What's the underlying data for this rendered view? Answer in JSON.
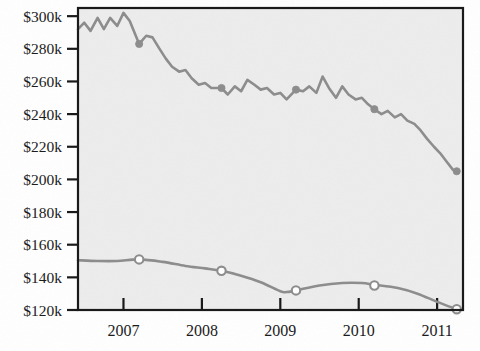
{
  "chart_data": {
    "type": "line",
    "title": "",
    "subtitle": "",
    "xlabel": "",
    "ylabel": "",
    "xlim": [
      2006.42,
      2011.33
    ],
    "ylim": [
      120000,
      305000
    ],
    "grid": false,
    "legend_position": "none",
    "background_color": "#ededed",
    "border_color": "#1a1a1a",
    "y_ticks": [
      120000,
      140000,
      160000,
      180000,
      200000,
      220000,
      240000,
      260000,
      280000,
      300000
    ],
    "y_tick_labels": [
      "$120k",
      "$140k",
      "$160k",
      "$180k",
      "$200k",
      "$220k",
      "$240k",
      "$260k",
      "$280k",
      "$300k"
    ],
    "x_ticks": [
      2007,
      2008,
      2009,
      2010,
      2011
    ],
    "x_tick_labels": [
      "2007",
      "2008",
      "2009",
      "2010",
      "2011"
    ],
    "series": [
      {
        "name": "upper-series",
        "style": "jagged",
        "color": "#8d8d8d",
        "line_width": 2.6,
        "marker": "filled-circle",
        "marker_color": "#8d8d8d",
        "marker_radius": 3.6,
        "marker_x": [
          2007.2,
          2008.25,
          2009.2,
          2010.2,
          2011.25
        ],
        "marker_y": [
          283000,
          256000,
          255000,
          243000,
          205000
        ],
        "x": [
          2006.42,
          2006.5,
          2006.58,
          2006.67,
          2006.75,
          2006.83,
          2006.92,
          2007.0,
          2007.08,
          2007.2,
          2007.29,
          2007.37,
          2007.46,
          2007.54,
          2007.62,
          2007.71,
          2007.79,
          2007.87,
          2007.96,
          2008.04,
          2008.12,
          2008.25,
          2008.33,
          2008.42,
          2008.5,
          2008.58,
          2008.67,
          2008.75,
          2008.83,
          2008.92,
          2009.0,
          2009.08,
          2009.2,
          2009.29,
          2009.37,
          2009.46,
          2009.54,
          2009.62,
          2009.71,
          2009.79,
          2009.87,
          2009.96,
          2010.04,
          2010.12,
          2010.2,
          2010.29,
          2010.37,
          2010.46,
          2010.54,
          2010.62,
          2010.71,
          2010.79,
          2010.87,
          2010.96,
          2011.04,
          2011.12,
          2011.2,
          2011.25
        ],
        "y": [
          292000,
          296000,
          291000,
          299000,
          292000,
          299000,
          294000,
          302000,
          297000,
          283000,
          288000,
          287000,
          280000,
          274000,
          269000,
          266000,
          267000,
          262000,
          258000,
          259000,
          256000,
          256000,
          252000,
          257000,
          254000,
          261000,
          258000,
          255000,
          256000,
          252000,
          253000,
          249000,
          255000,
          254000,
          257000,
          253000,
          263000,
          256000,
          250000,
          257000,
          252000,
          249000,
          250000,
          246000,
          243000,
          240000,
          242000,
          238000,
          240000,
          236000,
          234000,
          230000,
          225000,
          220000,
          216000,
          211000,
          206000,
          205000
        ]
      },
      {
        "name": "lower-series",
        "style": "smooth",
        "color": "#8d8d8d",
        "line_width": 2.6,
        "marker": "hollow-circle",
        "marker_color": "#8d8d8d",
        "marker_fill": "#ffffff",
        "marker_radius": 4.2,
        "marker_x": [
          2007.2,
          2008.25,
          2009.2,
          2010.2,
          2011.25
        ],
        "marker_y": [
          151000,
          144000,
          132000,
          135000,
          120500
        ],
        "x": [
          2006.42,
          2006.67,
          2006.92,
          2007.2,
          2007.5,
          2007.79,
          2008.04,
          2008.25,
          2008.5,
          2008.75,
          2009.0,
          2009.08,
          2009.2,
          2009.5,
          2009.79,
          2010.04,
          2010.2,
          2010.5,
          2010.75,
          2011.0,
          2011.25
        ],
        "y": [
          150500,
          150000,
          150000,
          151000,
          149500,
          147000,
          145500,
          144000,
          141000,
          137000,
          131500,
          131000,
          132000,
          135000,
          136500,
          136500,
          135500,
          133500,
          130000,
          125000,
          120500
        ]
      }
    ]
  }
}
